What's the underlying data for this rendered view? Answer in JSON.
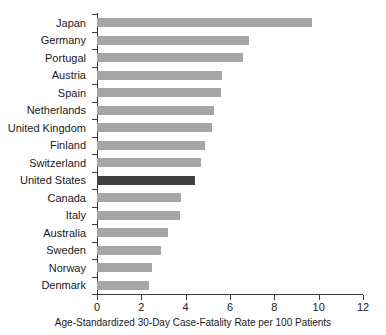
{
  "chart_data": {
    "type": "bar",
    "orientation": "horizontal",
    "title": "",
    "xlabel": "Age-Standardized 30-Day Case-Fatality Rate per 100 Patients",
    "ylabel": "",
    "xlim": [
      0,
      12
    ],
    "xticks": [
      0,
      2,
      4,
      6,
      8,
      10,
      12
    ],
    "xtick_labels": [
      "0",
      "2",
      "4",
      "6",
      "8",
      "10",
      "12"
    ],
    "grid": false,
    "legend": null,
    "categories": [
      "Japan",
      "Germany",
      "Portugal",
      "Austria",
      "Spain",
      "Netherlands",
      "United Kingdom",
      "Finland",
      "Switzerland",
      "United States",
      "Canada",
      "Italy",
      "Australia",
      "Sweden",
      "Norway",
      "Denmark"
    ],
    "values": [
      9.7,
      6.85,
      6.6,
      5.65,
      5.6,
      5.3,
      5.2,
      4.85,
      4.7,
      4.4,
      3.8,
      3.75,
      3.2,
      2.9,
      2.5,
      2.35
    ],
    "highlight_category": "United States",
    "colors": {
      "bar": "#a6a6a6",
      "highlight_bar": "#404040",
      "axis": "#3b3b3b",
      "text": "#1a1a1a",
      "background": "#ffffff"
    }
  }
}
